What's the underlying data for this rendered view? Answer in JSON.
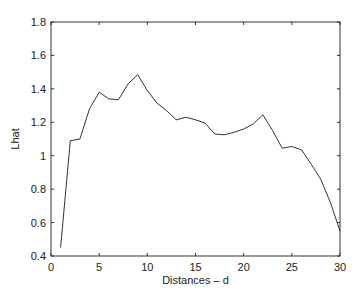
{
  "chart_data": {
    "type": "line",
    "title": "",
    "xlabel": "Distances – d",
    "ylabel": "Lhat",
    "xlim": [
      0,
      30
    ],
    "ylim": [
      0.4,
      1.8
    ],
    "xticks": [
      0,
      5,
      10,
      15,
      20,
      25,
      30
    ],
    "yticks": [
      0.4,
      0.6,
      0.8,
      1,
      1.2,
      1.4,
      1.6,
      1.8
    ],
    "grid": false,
    "legend": null,
    "x": [
      1,
      2,
      3,
      4,
      5,
      6,
      7,
      8,
      9,
      10,
      11,
      12,
      13,
      14,
      15,
      16,
      17,
      18,
      19,
      20,
      21,
      22,
      23,
      24,
      25,
      26,
      27,
      28,
      29,
      30
    ],
    "series": [
      {
        "name": "Lhat",
        "color": "#333333",
        "values": [
          0.45,
          1.09,
          1.1,
          1.28,
          1.38,
          1.34,
          1.335,
          1.43,
          1.485,
          1.39,
          1.315,
          1.27,
          1.215,
          1.23,
          1.215,
          1.195,
          1.13,
          1.125,
          1.14,
          1.16,
          1.19,
          1.245,
          1.15,
          1.045,
          1.055,
          1.035,
          0.95,
          0.86,
          0.72,
          0.55
        ]
      }
    ]
  }
}
